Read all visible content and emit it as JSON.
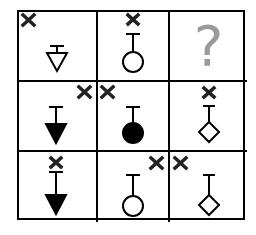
{
  "puzzle": {
    "type": "3x3 visual analogy matrix",
    "question_mark": "?",
    "colors": {
      "line": "#000000",
      "question": "#9a9a9a",
      "x_mark": "#222222"
    },
    "cells": [
      {
        "row": 1,
        "col": 1,
        "shape": "triangle-down",
        "fill": "outline",
        "x_mark": "top-left"
      },
      {
        "row": 1,
        "col": 2,
        "shape": "circle",
        "fill": "outline",
        "x_mark": "top-center"
      },
      {
        "row": 1,
        "col": 3,
        "shape": "unknown",
        "fill": "",
        "x_mark": "",
        "label": "?"
      },
      {
        "row": 2,
        "col": 1,
        "shape": "triangle-down",
        "fill": "solid",
        "x_mark": "top-right"
      },
      {
        "row": 2,
        "col": 2,
        "shape": "circle",
        "fill": "solid",
        "x_mark": "top-left"
      },
      {
        "row": 2,
        "col": 3,
        "shape": "diamond",
        "fill": "outline",
        "x_mark": "top-center"
      },
      {
        "row": 3,
        "col": 1,
        "shape": "triangle-down",
        "fill": "solid",
        "x_mark": "top-center"
      },
      {
        "row": 3,
        "col": 2,
        "shape": "circle",
        "fill": "outline",
        "x_mark": "top-right"
      },
      {
        "row": 3,
        "col": 3,
        "shape": "diamond",
        "fill": "outline",
        "x_mark": "top-left"
      }
    ]
  }
}
